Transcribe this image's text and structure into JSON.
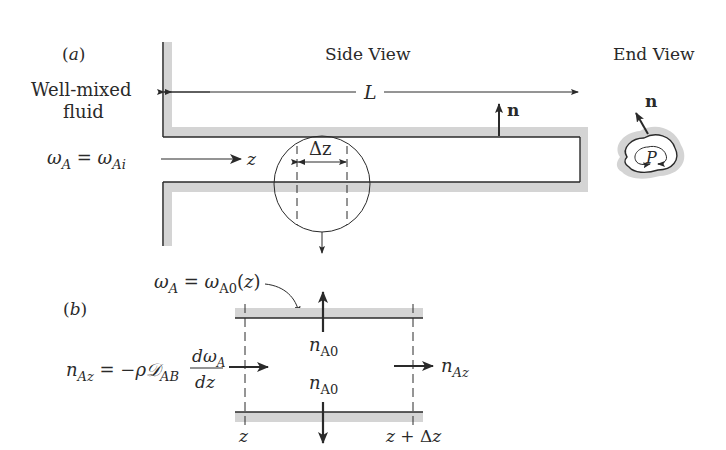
{
  "figure": {
    "panel_a": {
      "label": "(a)",
      "side_view_title": "Side View",
      "end_view_title": "End View",
      "fluid_label_line1": "Well-mixed",
      "fluid_label_line2": "fluid",
      "inlet_condition": {
        "lhs": "ω",
        "lhs_sub": "A",
        "eq": " = ",
        "rhs": "ω",
        "rhs_sub": "Ai"
      },
      "axis_label": "z",
      "length_label": "L",
      "normal_label": "n",
      "element_label": "Δz",
      "perimeter_label": "P"
    },
    "panel_b": {
      "label": "(b)",
      "wall_condition": {
        "lhs": "ω",
        "lhs_sub": "A",
        "eq": " = ",
        "rhs": "ω",
        "rhs_sub": "A0",
        "arg": "(z)"
      },
      "flux_in_expr": {
        "lhs": "n",
        "lhs_sub": "Az",
        "eq": " = −ρ",
        "diff": "𝒟",
        "diff_sub": "AB",
        "num": "dω",
        "num_sub": "A",
        "den": "dz"
      },
      "wall_flux_top": {
        "sym": "n",
        "sub": "A0"
      },
      "wall_flux_bottom": {
        "sym": "n",
        "sub": "A0"
      },
      "flux_out": {
        "sym": "n",
        "sub": "Az"
      },
      "left_boundary": "z",
      "right_boundary": "z + Δz"
    },
    "colors": {
      "wall_fill": "#d4d4d4",
      "line": "#2a2a2a",
      "background": "#ffffff"
    }
  }
}
